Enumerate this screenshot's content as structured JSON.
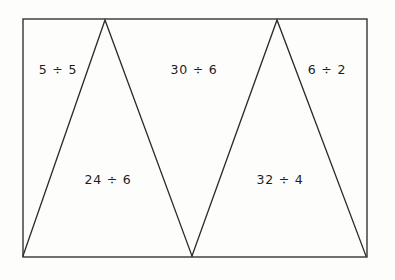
{
  "figure": {
    "background_color": "#fdfdfc",
    "line_color": "#2b2b2b",
    "text_color": "#1d1d1d",
    "canvas": {
      "width": 395,
      "height": 280
    },
    "rectangle": {
      "name": "outer-rectangle",
      "x": 23,
      "y": 19,
      "width": 344,
      "height": 238
    },
    "triangles": [
      {
        "name": "left-triangle",
        "apex": {
          "x": 105,
          "y": 20
        },
        "base_left": {
          "x": 23,
          "y": 256
        },
        "base_right": {
          "x": 192,
          "y": 256
        }
      },
      {
        "name": "right-triangle",
        "apex": {
          "x": 277,
          "y": 20
        },
        "base_left": {
          "x": 192,
          "y": 256
        },
        "base_right": {
          "x": 366,
          "y": 256
        }
      }
    ],
    "labels": [
      {
        "id": "label-top-left",
        "text": "5 ÷ 5",
        "x": 58,
        "y": 70,
        "region": "outside-left-of-left-triangle"
      },
      {
        "id": "label-top-middle",
        "text": "30 ÷ 6",
        "x": 194,
        "y": 70,
        "region": "between-triangles-upper"
      },
      {
        "id": "label-top-right",
        "text": "6 ÷ 2",
        "x": 327,
        "y": 70,
        "region": "outside-right-of-right-triangle"
      },
      {
        "id": "label-bottom-left",
        "text": "24 ÷ 6",
        "x": 108,
        "y": 180,
        "region": "inside-left-triangle"
      },
      {
        "id": "label-bottom-right",
        "text": "32 ÷ 4",
        "x": 280,
        "y": 180,
        "region": "inside-right-triangle"
      }
    ]
  }
}
